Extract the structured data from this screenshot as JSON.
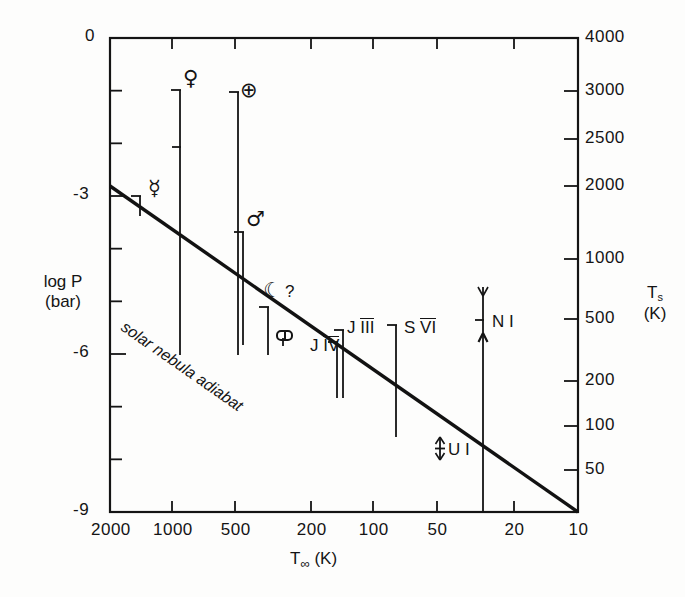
{
  "chart_data": {
    "type": "scatter",
    "title": "",
    "xlabel": "T∞ (K)",
    "ylabel": "log P (bar)",
    "y2label": "Ts (K)",
    "xlabel_parts": {
      "base": "T",
      "sub": "∞",
      "unit": "(K)"
    },
    "ylabel_parts": {
      "line1": "log P",
      "line2": "(bar)"
    },
    "y2label_parts": {
      "base": "T",
      "sub": "s",
      "unit": "(K)"
    },
    "grid": false,
    "legend": "none",
    "x_scale": "log-reversed",
    "xlim": [
      2000,
      10
    ],
    "ylim": [
      -9,
      0
    ],
    "x_ticks": [
      {
        "value": 2000,
        "label": "2000",
        "px": 110
      },
      {
        "value": 1000,
        "label": "1000",
        "px": 172
      },
      {
        "value": 500,
        "label": "500",
        "px": 235
      },
      {
        "value": 200,
        "label": "200",
        "px": 311
      },
      {
        "value": 100,
        "label": "100",
        "px": 373
      },
      {
        "value": 50,
        "label": "50",
        "px": 437
      },
      {
        "value": 20,
        "label": "20",
        "px": 514
      },
      {
        "value": 10,
        "label": "10",
        "px": 578
      }
    ],
    "y_ticks_labeled": [
      {
        "value": 0,
        "label": "0",
        "px": 38
      },
      {
        "value": -3,
        "label": "-3",
        "px": 196
      },
      {
        "value": -6,
        "label": "-6",
        "px": 354
      },
      {
        "value": -9,
        "label": "-9",
        "px": 512
      }
    ],
    "y_ticks_minor": [
      -1,
      -2,
      -4,
      -5,
      -7,
      -8
    ],
    "y2_ticks": [
      {
        "value": 4000,
        "label": "4000",
        "px": 38
      },
      {
        "value": 3000,
        "label": "3000",
        "px": 91
      },
      {
        "value": 2500,
        "label": "2500",
        "px": 139
      },
      {
        "value": 2000,
        "label": "2000",
        "px": 186
      },
      {
        "value": 1000,
        "label": "1000",
        "px": 259
      },
      {
        "value": 500,
        "label": "500",
        "px": 319
      },
      {
        "value": 200,
        "label": "200",
        "px": 381
      },
      {
        "value": 100,
        "label": "100",
        "px": 426
      },
      {
        "value": 50,
        "label": "50",
        "px": 470
      }
    ],
    "curve": {
      "name": "solar nebula adiabat",
      "label": "solar nebula adiabat",
      "points": [
        {
          "x_px": 110,
          "y_px": 186
        },
        {
          "x_px": 578,
          "y_px": 512
        }
      ]
    },
    "bodies": [
      {
        "name": "Mercury",
        "symbol": "☿",
        "label": "",
        "x_px": 140,
        "top_px": 196,
        "bottom_px": 216,
        "cap": "top-bar",
        "sym_x": 148,
        "sym_y": 178
      },
      {
        "name": "Venus",
        "symbol": "♀",
        "label": "",
        "x_px": 180,
        "top_px": 90,
        "bottom_px": 355,
        "cap": "top-bar",
        "mid_tick_px": 147,
        "sym_x": 183,
        "sym_y": 68
      },
      {
        "name": "Earth",
        "symbol": "⊕",
        "label": "",
        "x_px": 238,
        "top_px": 92,
        "bottom_px": 355,
        "cap": "top-bar",
        "sym_x": 240,
        "sym_y": 80
      },
      {
        "name": "Mars",
        "symbol": "♂",
        "label": "",
        "x_px": 243,
        "top_px": 232,
        "bottom_px": 345,
        "cap": "top-bar",
        "sym_x": 246,
        "sym_y": 209
      },
      {
        "name": "Moon",
        "symbol": "☾",
        "label": "?",
        "x_px": 268,
        "top_px": 307,
        "bottom_px": 355,
        "cap": "top-bar",
        "sym_x": 263,
        "sym_y": 280
      },
      {
        "name": "Io",
        "symbol": "Io-glyph",
        "label": "",
        "x_px": 283,
        "top_px": 338,
        "bottom_px": 346,
        "cap": "none",
        "sym_x": 276,
        "sym_y": 330
      },
      {
        "name": "Callisto",
        "symbol": "",
        "label": "J IV",
        "label_overline": "IV",
        "x_px": 337,
        "top_px": 342,
        "bottom_px": 398,
        "cap": "top-bar",
        "sym_x": 310,
        "sym_y": 336
      },
      {
        "name": "Ganymede",
        "symbol": "",
        "label": "J III",
        "label_overline": "III",
        "x_px": 343,
        "top_px": 330,
        "bottom_px": 398,
        "cap": "top-bar",
        "sym_x": 347,
        "sym_y": 318
      },
      {
        "name": "Titan",
        "symbol": "",
        "label": "S VI",
        "label_overline": "VI",
        "x_px": 396,
        "top_px": 325,
        "bottom_px": 437,
        "cap": "top-bar",
        "sym_x": 404,
        "sym_y": 318
      },
      {
        "name": "Ariel",
        "symbol": "",
        "label": "U I",
        "x_px": 440,
        "top_px": 437,
        "bottom_px": 460,
        "cap": "double-arrow",
        "sym_x": 448,
        "sym_y": 440
      },
      {
        "name": "Triton",
        "symbol": "",
        "label": "N I",
        "x_px": 483,
        "top_px": 287,
        "bottom_px": 512,
        "cap": "y-fork-and-arrow",
        "mid_tick_px": 320,
        "sym_x": 492,
        "sym_y": 312
      }
    ]
  },
  "colors": {
    "ink": "#141414",
    "background": "#fdfdfc",
    "curve": "#121212"
  }
}
